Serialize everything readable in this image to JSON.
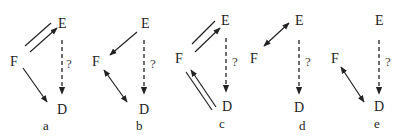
{
  "diagram": {
    "nodes": [
      "E",
      "F",
      "D"
    ],
    "question_mark": "?",
    "panels": [
      {
        "caption": "a",
        "labels": {
          "E": "E",
          "F": "F",
          "D": "D",
          "q": "?"
        },
        "edges": [
          {
            "from": "F",
            "to": "E",
            "style": "double-line, arrow on one toward E"
          },
          {
            "from": "F",
            "to": "D",
            "style": "single arrow"
          },
          {
            "from": "E",
            "to": "D",
            "style": "dashed arrow",
            "label": "?"
          }
        ]
      },
      {
        "caption": "b",
        "labels": {
          "E": "E",
          "F": "F",
          "D": "D",
          "q": "?"
        },
        "edges": [
          {
            "from": "E",
            "to": "F",
            "style": "single arrow"
          },
          {
            "from": "F",
            "to": "D",
            "style": "double-headed arrow"
          },
          {
            "from": "E",
            "to": "D",
            "style": "dashed arrow",
            "label": "?"
          }
        ]
      },
      {
        "caption": "c",
        "labels": {
          "E": "E",
          "F": "F",
          "D": "D",
          "q": "?"
        },
        "edges": [
          {
            "from": "F",
            "to": "E",
            "style": "double-line, arrow on one toward E"
          },
          {
            "from": "D",
            "to": "F",
            "style": "double-line, arrow on one toward F"
          },
          {
            "from": "E",
            "to": "D",
            "style": "dashed arrow",
            "label": "?"
          }
        ]
      },
      {
        "caption": "d",
        "labels": {
          "E": "E",
          "F": "F",
          "D": "D",
          "q": "?"
        },
        "edges": [
          {
            "from": "E",
            "to": "F",
            "style": "double-headed arrow"
          },
          {
            "from": "E",
            "to": "D",
            "style": "dashed arrow",
            "label": "?"
          }
        ]
      },
      {
        "caption": "e",
        "labels": {
          "E": "E",
          "F": "F",
          "D": "D",
          "q": "?"
        },
        "edges": [
          {
            "from": "F",
            "to": "D",
            "style": "double-headed arrow"
          },
          {
            "from": "E",
            "to": "D",
            "style": "dashed arrow",
            "label": "?"
          }
        ]
      }
    ]
  }
}
